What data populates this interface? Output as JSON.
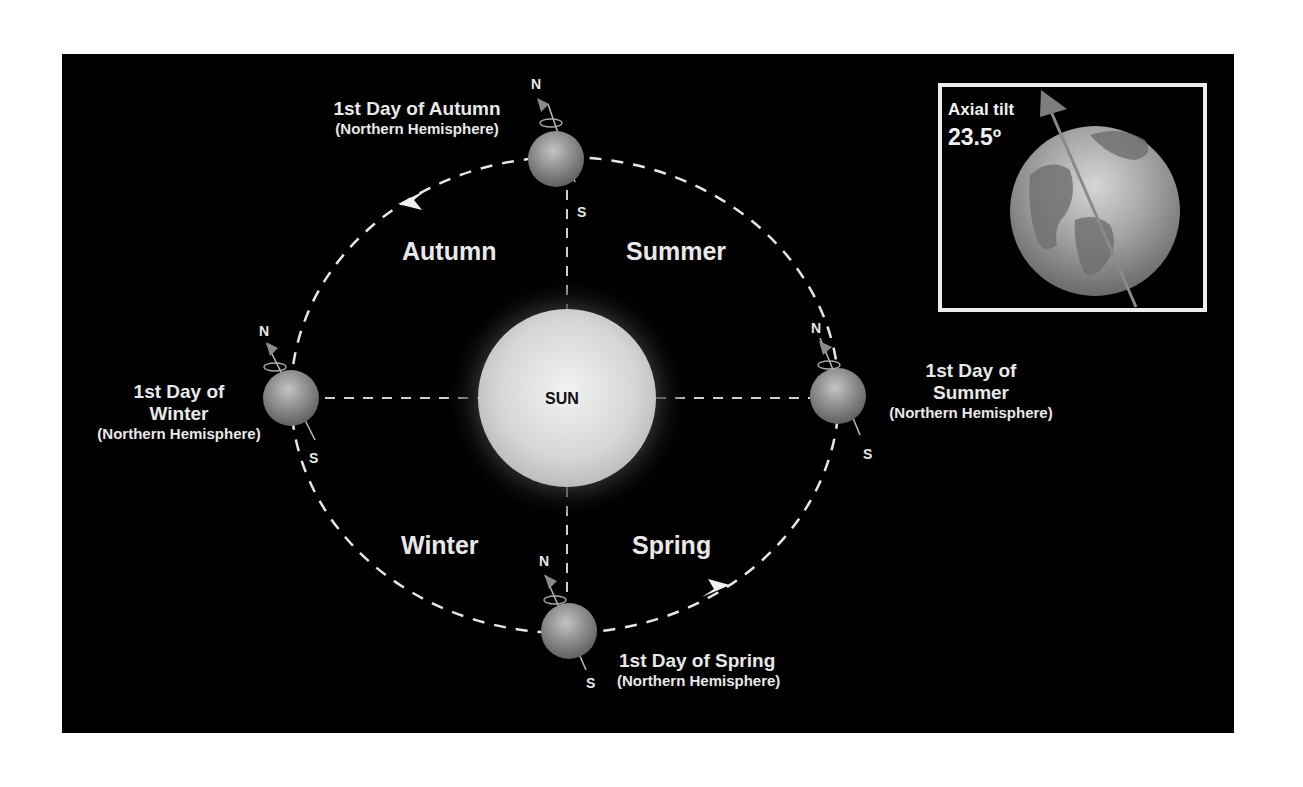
{
  "diagram": {
    "sun_label": "SUN",
    "seasons": [
      {
        "id": "autumn",
        "label": "Autumn"
      },
      {
        "id": "summer",
        "label": "Summer"
      },
      {
        "id": "winter",
        "label": "Winter"
      },
      {
        "id": "spring",
        "label": "Spring"
      }
    ],
    "positions": {
      "autumn": {
        "title": "1st Day of Autumn",
        "subtitle": "(Northern Hemisphere)",
        "north": "N",
        "south": "S"
      },
      "winter": {
        "title_line1": "1st Day of",
        "title_line2": "Winter",
        "subtitle": "(Northern Hemisphere)",
        "north": "N",
        "south": "S"
      },
      "summer": {
        "title_line1": "1st Day of",
        "title_line2": "Summer",
        "subtitle": "(Northern Hemisphere)",
        "north": "N",
        "south": "S"
      },
      "spring": {
        "title": "1st Day of Spring",
        "subtitle": "(Northern Hemisphere)",
        "north": "N",
        "south": "S"
      }
    },
    "inset": {
      "title": "Axial tilt",
      "value": "23.5º"
    },
    "colors": {
      "background": "#000000",
      "page": "#ffffff",
      "orbit": "#e6e6e6",
      "sun": "#d8d8d8",
      "earth": "#8c8c8c",
      "axis_arrow": "#7a7a7a"
    }
  }
}
